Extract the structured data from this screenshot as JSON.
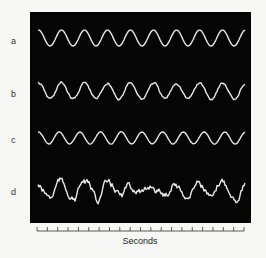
{
  "chart_data": {
    "type": "line",
    "title": "",
    "xlabel": "Seconds",
    "ylabel": "",
    "grid": false,
    "legend": "none",
    "x_ticks": 21,
    "series": [
      {
        "name": "a",
        "description": "regular sinusoidal oscillation",
        "cycles": 9,
        "noise": 0.0
      },
      {
        "name": "b",
        "description": "sinusoid with intermittent irregular notches",
        "cycles": 9,
        "noise": 0.35
      },
      {
        "name": "c",
        "description": "regular sinusoidal oscillation, lower amplitude",
        "cycles": 10,
        "noise": 0.05
      },
      {
        "name": "d",
        "description": "irregular noisy waveform",
        "cycles": 9,
        "noise": 1.0
      }
    ]
  },
  "labels": {
    "a": "a",
    "b": "b",
    "c": "c",
    "d": "d",
    "xaxis": "Seconds"
  },
  "colors": {
    "panel": "#050505",
    "trace": "#e8e8e8",
    "background": "#f7f7f5"
  }
}
